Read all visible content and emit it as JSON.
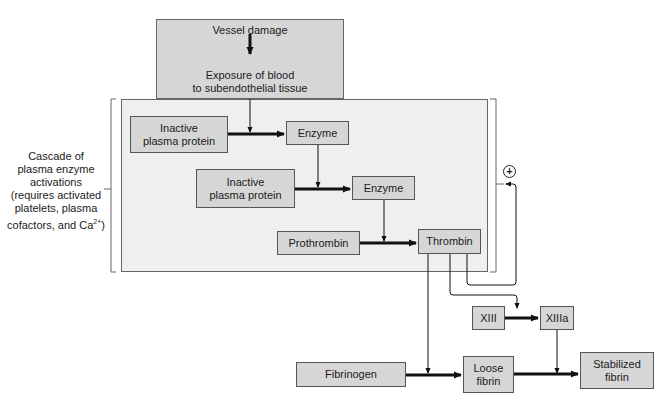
{
  "diagram": {
    "top_box": {
      "line1": "Vessel damage",
      "line2a": "Exposure of blood",
      "line2b": "to subendothelial tissue"
    },
    "side_label": {
      "lines": [
        "Cascade of",
        "plasma enzyme",
        "activations",
        "(requires activated",
        "platelets, plasma"
      ],
      "last_line_prefix": "cofactors, and Ca",
      "last_line_sup": "2+",
      "last_line_suffix": ")"
    },
    "nodes": {
      "inactive1": [
        "Inactive",
        "plasma protein"
      ],
      "enzyme1": "Enzyme",
      "inactive2": [
        "Inactive",
        "plasma protein"
      ],
      "enzyme2": "Enzyme",
      "prothrombin": "Prothrombin",
      "thrombin": "Thrombin",
      "xiii": "XIII",
      "xiiia": "XIIIa",
      "fibrinogen": "Fibrinogen",
      "loose_fibrin": [
        "Loose",
        "fibrin"
      ],
      "stabilized_fibrin": [
        "Stabilized",
        "fibrin"
      ]
    },
    "feedback_symbol": "+",
    "colors": {
      "box_fill": "#d6d6d6",
      "cascade_fill": "#efefef",
      "line": "#111111"
    }
  }
}
